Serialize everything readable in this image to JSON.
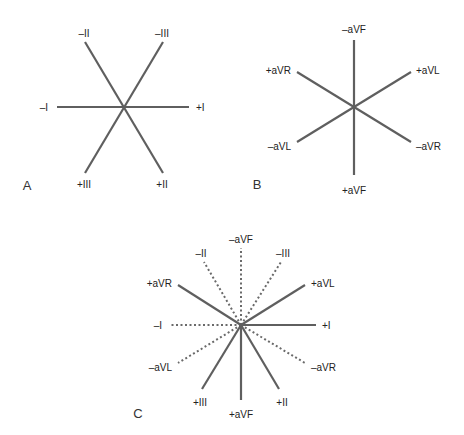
{
  "colors": {
    "line": "#5f5f5f",
    "text": "#222222",
    "background": "#ffffff"
  },
  "panels": {
    "A": {
      "letter": "A",
      "labels": {
        "neg_II": "–II",
        "neg_III": "–III",
        "neg_I": "–I",
        "pos_I": "+I",
        "pos_III": "+III",
        "pos_II": "+II"
      }
    },
    "B": {
      "letter": "B",
      "labels": {
        "neg_aVF": "–aVF",
        "pos_aVR": "+aVR",
        "pos_aVL": "+aVL",
        "neg_aVL": "–aVL",
        "neg_aVR": "–aVR",
        "pos_aVF": "+aVF"
      }
    },
    "C": {
      "letter": "C",
      "labels": {
        "neg_aVF": "–aVF",
        "neg_II": "–II",
        "neg_III": "–III",
        "pos_aVR": "+aVR",
        "pos_aVL": "+aVL",
        "neg_I": "–I",
        "pos_I": "+I",
        "neg_aVL": "–aVL",
        "neg_aVR": "–aVR",
        "pos_III": "+III",
        "pos_aVF": "+aVF",
        "pos_II": "+II"
      }
    }
  }
}
